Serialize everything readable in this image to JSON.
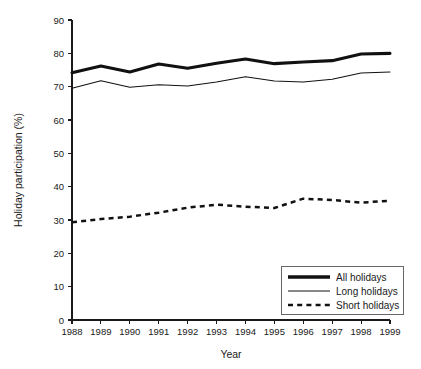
{
  "chart_data": {
    "type": "line",
    "title": "",
    "xlabel": "Year",
    "ylabel": "Holiday participation (%)",
    "x": [
      1988,
      1989,
      1990,
      1991,
      1992,
      1993,
      1994,
      1995,
      1996,
      1997,
      1998,
      1999
    ],
    "categories": [
      "1988",
      "1989",
      "1990",
      "1991",
      "1992",
      "1993",
      "1994",
      "1995",
      "1996",
      "1997",
      "1998",
      "1999"
    ],
    "xlim": [
      1988,
      1999
    ],
    "ylim": [
      0,
      90
    ],
    "yticks": [
      0,
      10,
      20,
      30,
      40,
      50,
      60,
      70,
      80,
      90
    ],
    "ytick_labels": [
      "0",
      "10",
      "20",
      "30",
      "40",
      "50",
      "60",
      "70",
      "80",
      "90"
    ],
    "xticks": [
      1988,
      1989,
      1990,
      1991,
      1992,
      1993,
      1994,
      1995,
      1996,
      1997,
      1998,
      1999
    ],
    "grid": false,
    "legend_position": "bottom-right",
    "series": [
      {
        "name": "All holidays",
        "style": "thick-solid",
        "color": "#111111",
        "values": [
          74.2,
          76.2,
          74.4,
          76.8,
          75.5,
          77.0,
          78.3,
          76.9,
          77.4,
          77.8,
          79.8,
          80.0
        ]
      },
      {
        "name": "Long holidays",
        "style": "thin-solid",
        "color": "#111111",
        "values": [
          69.5,
          71.8,
          69.8,
          70.6,
          70.2,
          71.4,
          73.0,
          71.7,
          71.4,
          72.2,
          74.1,
          74.4
        ]
      },
      {
        "name": "Short holidays",
        "style": "dashed",
        "color": "#111111",
        "values": [
          29.3,
          30.3,
          31.0,
          32.2,
          33.7,
          34.6,
          34.0,
          33.6,
          36.4,
          36.0,
          35.2,
          35.8
        ]
      }
    ]
  },
  "legend": {
    "items": [
      {
        "label": "All holidays"
      },
      {
        "label": "Long holidays"
      },
      {
        "label": "Short holidays"
      }
    ]
  }
}
